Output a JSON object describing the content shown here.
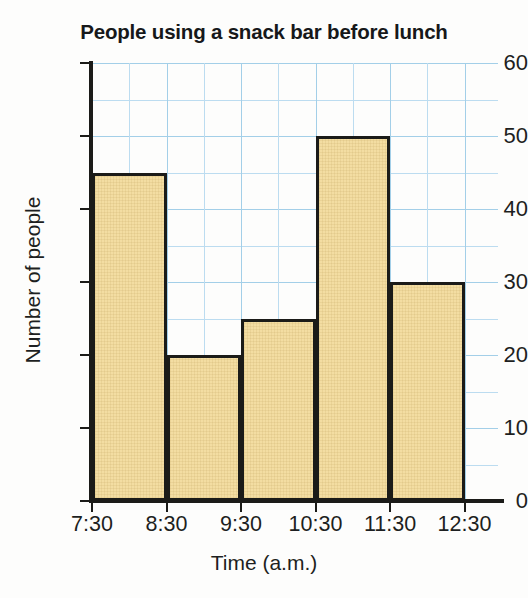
{
  "chart_data": {
    "type": "bar",
    "title": "People using a snack bar before lunch",
    "xlabel": "Time (a.m.)",
    "ylabel": "Number of people",
    "categories": [
      "7:30–8:30",
      "8:30–9:30",
      "9:30–10:30",
      "10:30–11:30",
      "11:30–12:30"
    ],
    "values": [
      45,
      20,
      25,
      50,
      30
    ],
    "bin_edges": [
      "7:30",
      "8:30",
      "9:30",
      "10:30",
      "11:30",
      "12:30"
    ],
    "x_tick_labels": [
      "7:30",
      "8:30",
      "9:30",
      "10:30",
      "11:30",
      "12:30"
    ],
    "y_tick_labels": [
      "0",
      "10",
      "20",
      "30",
      "40",
      "50",
      "60"
    ],
    "y_ticks": [
      0,
      10,
      20,
      30,
      40,
      50,
      60
    ],
    "ylim": [
      0,
      60
    ],
    "y_minor_step": 5,
    "grid": true,
    "grid_color": "#a3cfe8",
    "legend": null,
    "bar_fill_color": "#f3dda2",
    "bar_edge_color": "#1b1b18",
    "axis_color": "#1b1b18"
  },
  "chart": {
    "title": "People using a snack bar before lunch",
    "x_axis_title": "Time (a.m.)",
    "y_axis_title": "Number of people"
  }
}
